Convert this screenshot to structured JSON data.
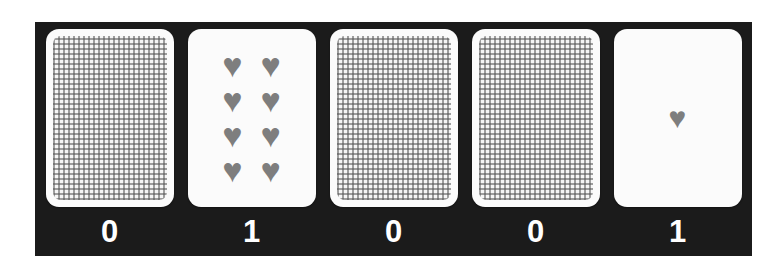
{
  "colors": {
    "page_background": "#ffffff",
    "panel_background": "#1b1b1b",
    "card_face": "#fbfbfb",
    "heart": "#7e7e7e",
    "label_text": "#ffffff"
  },
  "icons": {
    "heart_glyph": "♥",
    "card_back_pattern": "gingham-check"
  },
  "cards": [
    {
      "face": "down",
      "hearts": 0,
      "label": "0"
    },
    {
      "face": "up",
      "hearts": 8,
      "label": "1"
    },
    {
      "face": "down",
      "hearts": 0,
      "label": "0"
    },
    {
      "face": "down",
      "hearts": 0,
      "label": "0"
    },
    {
      "face": "up",
      "hearts": 1,
      "label": "1"
    }
  ],
  "indicator_row": [
    "0",
    "1",
    "0",
    "0",
    "1"
  ]
}
